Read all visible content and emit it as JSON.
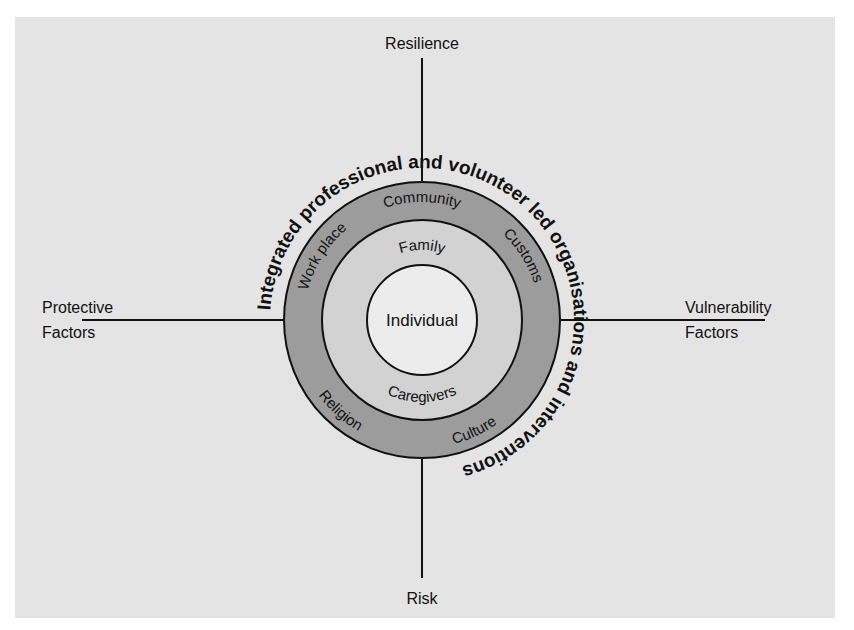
{
  "diagram": {
    "axes": {
      "top": "Resilience",
      "bottom": "Risk",
      "left": [
        "Protective",
        "Factors"
      ],
      "right": [
        "Vulnerability",
        "Factors"
      ]
    },
    "outer_arc_text": "Integrated professional and volunteer led organisations and interventions",
    "outer_ring": {
      "labels": [
        "Work place",
        "Community",
        "Customs",
        "Religion",
        "Culture"
      ],
      "color": "#9c9c9c"
    },
    "middle_ring": {
      "labels": [
        "Family",
        "Caregivers"
      ],
      "color": "#d2d2d2"
    },
    "center": {
      "label": "Individual",
      "color": "#ececec"
    },
    "background_color": "#e4e4e4"
  }
}
